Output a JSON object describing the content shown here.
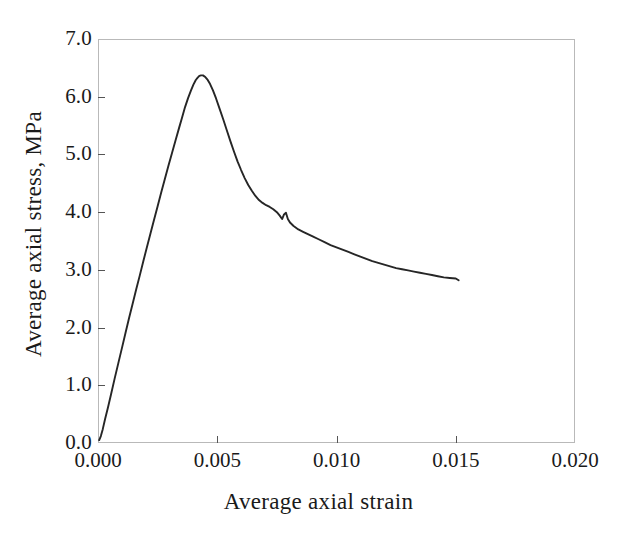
{
  "chart_data": {
    "type": "line",
    "title": "",
    "xlabel": "Average axial strain",
    "ylabel": "Average axial stress, MPa",
    "xlim": [
      0.0,
      0.02
    ],
    "ylim": [
      0.0,
      7.0
    ],
    "xticks": [
      "0.000",
      "0.005",
      "0.010",
      "0.015",
      "0.020"
    ],
    "xtick_values": [
      0.0,
      0.005,
      0.01,
      0.015,
      0.02
    ],
    "yticks": [
      "0.0",
      "1.0",
      "2.0",
      "3.0",
      "4.0",
      "5.0",
      "6.0",
      "7.0"
    ],
    "ytick_values": [
      0.0,
      1.0,
      2.0,
      3.0,
      4.0,
      5.0,
      6.0,
      7.0
    ],
    "grid": false,
    "legend": null,
    "series": [
      {
        "name": "Average axial stress vs average axial strain",
        "color": "#262626",
        "x": [
          5e-05,
          0.00012,
          0.0002,
          0.0003,
          0.00042,
          0.00055,
          0.0007,
          0.00085,
          0.001,
          0.00115,
          0.0013,
          0.00145,
          0.0016,
          0.00175,
          0.0019,
          0.00205,
          0.0022,
          0.00235,
          0.0025,
          0.00265,
          0.0028,
          0.00295,
          0.0031,
          0.00325,
          0.0034,
          0.00352,
          0.00365,
          0.00378,
          0.0039,
          0.004,
          0.0041,
          0.00418,
          0.00425,
          0.00432,
          0.0044,
          0.0045,
          0.0046,
          0.0047,
          0.00482,
          0.00495,
          0.0051,
          0.00525,
          0.0054,
          0.00555,
          0.0057,
          0.00585,
          0.006,
          0.00615,
          0.0063,
          0.00645,
          0.0066,
          0.00675,
          0.0069,
          0.00705,
          0.0072,
          0.00735,
          0.0075,
          0.00762,
          0.00772,
          0.0078,
          0.00788,
          0.00796,
          0.00805,
          0.0082,
          0.0084,
          0.0086,
          0.0088,
          0.009,
          0.00925,
          0.0095,
          0.00975,
          0.01,
          0.01025,
          0.0105,
          0.01075,
          0.011,
          0.01125,
          0.0115,
          0.01175,
          0.012,
          0.01225,
          0.0125,
          0.01275,
          0.013,
          0.01325,
          0.0135,
          0.01375,
          0.014,
          0.01425,
          0.0145,
          0.01475,
          0.015,
          0.01512
        ],
        "y": [
          0.05,
          0.12,
          0.24,
          0.42,
          0.62,
          0.85,
          1.12,
          1.38,
          1.64,
          1.9,
          2.16,
          2.41,
          2.66,
          2.9,
          3.15,
          3.39,
          3.63,
          3.87,
          4.1,
          4.34,
          4.57,
          4.8,
          5.02,
          5.24,
          5.46,
          5.63,
          5.82,
          5.98,
          6.11,
          6.21,
          6.29,
          6.33,
          6.36,
          6.37,
          6.37,
          6.34,
          6.29,
          6.22,
          6.11,
          5.97,
          5.79,
          5.61,
          5.42,
          5.23,
          5.05,
          4.88,
          4.73,
          4.59,
          4.47,
          4.37,
          4.28,
          4.21,
          4.16,
          4.12,
          4.09,
          4.05,
          4.0,
          3.94,
          3.88,
          3.96,
          3.99,
          3.88,
          3.82,
          3.76,
          3.7,
          3.66,
          3.62,
          3.58,
          3.53,
          3.48,
          3.43,
          3.39,
          3.35,
          3.31,
          3.27,
          3.23,
          3.19,
          3.15,
          3.12,
          3.09,
          3.06,
          3.03,
          3.01,
          2.99,
          2.97,
          2.95,
          2.93,
          2.91,
          2.89,
          2.87,
          2.86,
          2.85,
          2.82
        ]
      }
    ]
  },
  "axes": {
    "x_title": "Average axial strain",
    "y_title": "Average axial stress, MPa"
  }
}
